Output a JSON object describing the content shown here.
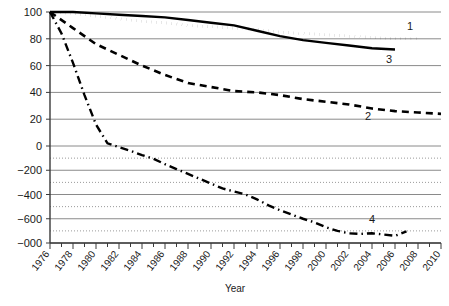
{
  "chart_data": {
    "type": "line",
    "title": "",
    "xlabel": "Year",
    "ylabel": "",
    "grid": true,
    "legend_position": "inline-at-line-end",
    "xlim": [
      1976,
      2010
    ],
    "ylim": [
      -800,
      100
    ],
    "x_tick_labels": [
      "1976",
      "1978",
      "1980",
      "1982",
      "1984",
      "1986",
      "1988",
      "1990",
      "1992",
      "1994",
      "1996",
      "1998",
      "2000",
      "2002",
      "2004",
      "2006",
      "2008",
      "2010"
    ],
    "y_tick_labels": [
      "100",
      "80",
      "60",
      "40",
      "20",
      "0",
      "−200",
      "−400",
      "−600",
      "−000"
    ],
    "y_tick_values": [
      100,
      80,
      60,
      40,
      20,
      0,
      -200,
      -400,
      -600,
      -800
    ],
    "y_minor_dotted_values": [
      -100,
      -300,
      -500,
      -700
    ],
    "series": [
      {
        "name": "1",
        "label": "1",
        "style": "dotted",
        "x": [
          1976,
          1978,
          1980,
          1982,
          1984,
          1986,
          1988,
          1990,
          1992,
          1994,
          1996,
          1998,
          2000,
          2002,
          2004,
          2006,
          2008
        ],
        "values": [
          100,
          99,
          97,
          95,
          93,
          92,
          90,
          89,
          88,
          87,
          85,
          84,
          83,
          82,
          81,
          80,
          80
        ]
      },
      {
        "name": "2",
        "label": "2",
        "style": "dashed",
        "x": [
          1976,
          1978,
          1980,
          1982,
          1984,
          1986,
          1988,
          1990,
          1992,
          1994,
          1996,
          1998,
          2000,
          2002,
          2004,
          2006,
          2008,
          2010
        ],
        "values": [
          100,
          88,
          76,
          68,
          60,
          53,
          47,
          44,
          41,
          40,
          38,
          35,
          33,
          31,
          28,
          26,
          25,
          24
        ]
      },
      {
        "name": "3",
        "label": "3",
        "style": "solid",
        "x": [
          1976,
          1978,
          1980,
          1982,
          1984,
          1986,
          1988,
          1990,
          1992,
          1994,
          1996,
          1998,
          2000,
          2002,
          2004,
          2006
        ],
        "values": [
          100,
          100,
          99,
          98,
          97,
          96,
          94,
          92,
          90,
          86,
          82,
          79,
          77,
          75,
          73,
          72
        ]
      },
      {
        "name": "4",
        "label": "4",
        "style": "dash-dot",
        "x": [
          1976,
          1977,
          1978,
          1979,
          1980,
          1981,
          1982,
          1983,
          1984,
          1985,
          1986,
          1987,
          1988,
          1989,
          1990,
          1991,
          1992,
          1993,
          1994,
          1995,
          1996,
          1997,
          1998,
          1999,
          2000,
          2001,
          2002,
          2003,
          2004,
          2005,
          2006,
          2007
        ],
        "values": [
          100,
          84,
          62,
          38,
          16,
          2,
          -10,
          -40,
          -75,
          -105,
          -150,
          -190,
          -230,
          -270,
          -310,
          -350,
          -375,
          -400,
          -440,
          -490,
          -530,
          -565,
          -600,
          -630,
          -670,
          -700,
          -720,
          -725,
          -720,
          -730,
          -740,
          -705
        ]
      }
    ]
  }
}
